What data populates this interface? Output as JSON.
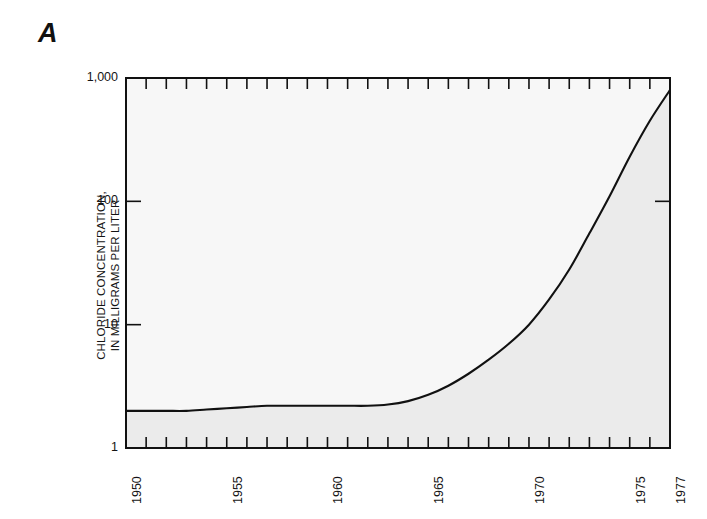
{
  "figure": {
    "panel_label": "A",
    "axes": {
      "y_title_line1": "CHLORIDE CONCENTRATION,",
      "y_title_line2": "IN MILLIGRAMS PER LITER",
      "x_title": ""
    }
  },
  "chart_data": {
    "type": "area",
    "title": "A",
    "xlabel": "",
    "ylabel": "CHLORIDE CONCENTRATION, IN MILLIGRAMS PER LITER",
    "x_tick_labels": [
      "1950",
      "1955",
      "1960",
      "1965",
      "1970",
      "1975",
      "1977"
    ],
    "x_tick_values": [
      1950,
      1955,
      1960,
      1965,
      1970,
      1975,
      1977
    ],
    "x_minor_tick_interval": 1,
    "xlim": [
      1950,
      1977
    ],
    "y_tick_labels": [
      "1",
      "10",
      "100",
      "1,000"
    ],
    "y_tick_values": [
      1,
      10,
      100,
      1000
    ],
    "ylim": [
      1,
      1000
    ],
    "y_scale": "log",
    "grid": false,
    "legend": false,
    "fill_color": "#ebebeb",
    "plot_background": "#f7f7f7",
    "line_color": "#111111",
    "x": [
      1950,
      1951,
      1952,
      1953,
      1954,
      1955,
      1956,
      1957,
      1958,
      1959,
      1960,
      1961,
      1962,
      1963,
      1964,
      1965,
      1966,
      1967,
      1968,
      1969,
      1970,
      1971,
      1972,
      1973,
      1974,
      1975,
      1976,
      1977
    ],
    "values": [
      2.0,
      2.0,
      2.0,
      2.0,
      2.05,
      2.1,
      2.15,
      2.2,
      2.2,
      2.2,
      2.2,
      2.2,
      2.2,
      2.25,
      2.4,
      2.7,
      3.2,
      4.0,
      5.2,
      7.0,
      10.0,
      16.0,
      28.0,
      55.0,
      110.0,
      230.0,
      450.0,
      800.0
    ],
    "series": [
      {
        "name": "Chloride concentration",
        "values": [
          2.0,
          2.0,
          2.0,
          2.0,
          2.05,
          2.1,
          2.15,
          2.2,
          2.2,
          2.2,
          2.2,
          2.2,
          2.2,
          2.25,
          2.4,
          2.7,
          3.2,
          4.0,
          5.2,
          7.0,
          10.0,
          16.0,
          28.0,
          55.0,
          110.0,
          230.0,
          450.0,
          800.0
        ]
      }
    ]
  }
}
